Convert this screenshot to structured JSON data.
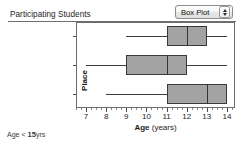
{
  "header": {
    "title": "Participating Students",
    "view_selector": {
      "label": "Box Plot",
      "icon": "up-down-chevrons-icon"
    }
  },
  "footer": {
    "note_prefix": "Age < ",
    "note_value": "15",
    "note_suffix": "yrs",
    "note_full": "Age < 15yrs"
  },
  "chart_data": {
    "type": "box",
    "title": "Participating Students",
    "xlabel_bold": "Age",
    "xlabel_rest": " (years)",
    "xlabel": "Age (years)",
    "ylabel": "Place",
    "xlim": [
      6.5,
      14.4
    ],
    "xticks": [
      7,
      8,
      9,
      10,
      11,
      12,
      13,
      14
    ],
    "xtick_labels": [
      "7",
      "8",
      "9",
      "10",
      "11",
      "12",
      "13",
      "14"
    ],
    "grid": false,
    "legend": "none",
    "categories": [
      "Queensland",
      "UK",
      "South Africa"
    ],
    "boxes": [
      {
        "category": "Queensland",
        "whisker_low": 9,
        "q1": 11,
        "median": 12,
        "q3": 13,
        "whisker_high": 14
      },
      {
        "category": "UK",
        "whisker_low": 7,
        "q1": 9,
        "median": 11,
        "q3": 12,
        "whisker_high": 14
      },
      {
        "category": "South Africa",
        "whisker_low": 8,
        "q1": 11,
        "median": 13,
        "q3": 14,
        "whisker_high": 14
      }
    ]
  },
  "colors": {
    "box_fill": "#a3a3a3",
    "box_stroke": "#3a3a3a",
    "frame": "#6d6d6d",
    "text": "#1c1c1c",
    "background": "#ffffff"
  }
}
